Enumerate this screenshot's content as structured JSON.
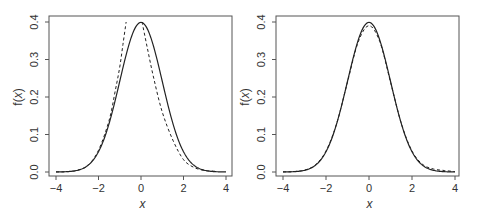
{
  "chart_data": [
    {
      "type": "line",
      "panel": "left",
      "title": "",
      "xlabel": "x",
      "ylabel": "f(x)",
      "xlim": [
        -4,
        4
      ],
      "ylim": [
        0,
        0.4
      ],
      "xticks": [
        -4,
        -2,
        0,
        2,
        4
      ],
      "xtick_labels": [
        "−4",
        "−2",
        "0",
        "2",
        "4"
      ],
      "yticks": [
        0.0,
        0.1,
        0.2,
        0.3,
        0.4
      ],
      "ytick_labels": [
        "0.0",
        "0.1",
        "0.2",
        "0.3",
        "0.4"
      ],
      "grid": false,
      "legend": null,
      "series": [
        {
          "name": "standard normal density",
          "style": "solid",
          "x": [
            -4,
            -3.5,
            -3,
            -2.5,
            -2,
            -1.5,
            -1,
            -0.5,
            0,
            0.5,
            1,
            1.5,
            2,
            2.5,
            3,
            3.5,
            4
          ],
          "values": [
            0.0001,
            0.0009,
            0.0044,
            0.0175,
            0.054,
            0.1295,
            0.242,
            0.3521,
            0.3989,
            0.3521,
            0.242,
            0.1295,
            0.054,
            0.0175,
            0.0044,
            0.0009,
            0.0001
          ]
        },
        {
          "name": "approximation",
          "style": "dashed",
          "x": [
            -4,
            -3.5,
            -3,
            -2.5,
            -2,
            -1.5,
            -1.2,
            -1.0,
            -0.85,
            -0.7,
            null,
            0.05,
            0.3,
            0.6,
            1.0,
            1.5,
            2.0,
            2.5,
            3.0,
            3.5
          ],
          "values": [
            0.0001,
            0.0009,
            0.0044,
            0.0175,
            0.058,
            0.138,
            0.22,
            0.28,
            0.34,
            0.4,
            null,
            0.4,
            0.33,
            0.25,
            0.16,
            0.085,
            0.033,
            0.012,
            0.004,
            0.002
          ]
        }
      ]
    },
    {
      "type": "line",
      "panel": "right",
      "title": "",
      "xlabel": "x",
      "ylabel": "f(x)",
      "xlim": [
        -4,
        4
      ],
      "ylim": [
        0,
        0.4
      ],
      "xticks": [
        -4,
        -2,
        0,
        2,
        4
      ],
      "xtick_labels": [
        "−4",
        "−2",
        "0",
        "2",
        "4"
      ],
      "yticks": [
        0.0,
        0.1,
        0.2,
        0.3,
        0.4
      ],
      "ytick_labels": [
        "0.0",
        "0.1",
        "0.2",
        "0.3",
        "0.4"
      ],
      "grid": false,
      "legend": null,
      "series": [
        {
          "name": "standard normal density",
          "style": "solid",
          "x": [
            -4,
            -3.5,
            -3,
            -2.5,
            -2,
            -1.5,
            -1,
            -0.5,
            0,
            0.5,
            1,
            1.5,
            2,
            2.5,
            3,
            3.5,
            4
          ],
          "values": [
            0.0001,
            0.0009,
            0.0044,
            0.0175,
            0.054,
            0.1295,
            0.242,
            0.3521,
            0.3989,
            0.3521,
            0.242,
            0.1295,
            0.054,
            0.0175,
            0.0044,
            0.0009,
            0.0001
          ]
        },
        {
          "name": "approximation",
          "style": "dashed",
          "x": [
            -4,
            -3.5,
            -3,
            -2.5,
            -2,
            -1.5,
            -1,
            -0.5,
            0,
            0.5,
            1,
            1.5,
            2,
            2.5,
            3,
            3.5,
            4
          ],
          "values": [
            0.0002,
            0.0012,
            0.005,
            0.019,
            0.056,
            0.13,
            0.24,
            0.347,
            0.39,
            0.348,
            0.24,
            0.13,
            0.056,
            0.02,
            0.008,
            0.004,
            0.001
          ]
        }
      ]
    }
  ]
}
